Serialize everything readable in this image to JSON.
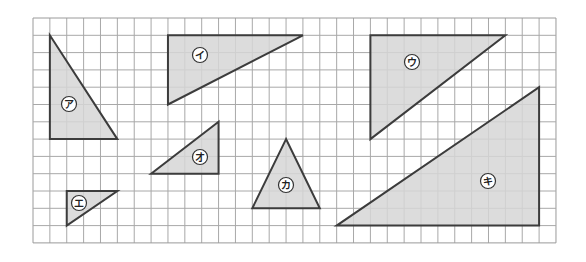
{
  "grid": {
    "origin_x": 33,
    "origin_y": 18,
    "cols": 31,
    "rows": 13,
    "cell_w": 16.87,
    "cell_h": 17.3,
    "line_color": "#a8a8a8",
    "border_color": "#9a9a9a"
  },
  "style": {
    "fill_color": "#d6d6d6",
    "stroke_color": "#3c3c3c",
    "label_fill": "#ffffff",
    "label_stroke": "#333333"
  },
  "triangles": [
    {
      "id": "a",
      "label": "ア",
      "vertices": [
        [
          1,
          1
        ],
        [
          1,
          7
        ],
        [
          5,
          7
        ]
      ],
      "label_pos": [
        69,
        104
      ]
    },
    {
      "id": "i",
      "label": "イ",
      "vertices": [
        [
          8,
          1
        ],
        [
          16,
          1
        ],
        [
          8,
          5
        ]
      ],
      "label_pos": [
        200,
        55
      ]
    },
    {
      "id": "u",
      "label": "ウ",
      "vertices": [
        [
          20,
          1
        ],
        [
          28,
          1
        ],
        [
          20,
          7
        ]
      ],
      "label_pos": [
        412,
        62
      ]
    },
    {
      "id": "e",
      "label": "エ",
      "vertices": [
        [
          2,
          10
        ],
        [
          5,
          10
        ],
        [
          2,
          12
        ]
      ],
      "label_pos": [
        79,
        203
      ]
    },
    {
      "id": "o",
      "label": "オ",
      "vertices": [
        [
          11,
          6
        ],
        [
          11,
          9
        ],
        [
          7,
          9
        ]
      ],
      "label_pos": [
        200,
        157
      ]
    },
    {
      "id": "ka",
      "label": "カ",
      "vertices": [
        [
          15,
          7
        ],
        [
          13,
          11
        ],
        [
          17,
          11
        ]
      ],
      "label_pos": [
        286,
        185
      ]
    },
    {
      "id": "ki",
      "label": "キ",
      "vertices": [
        [
          30,
          4
        ],
        [
          30,
          12
        ],
        [
          18,
          12
        ]
      ],
      "label_pos": [
        488,
        181
      ]
    }
  ]
}
